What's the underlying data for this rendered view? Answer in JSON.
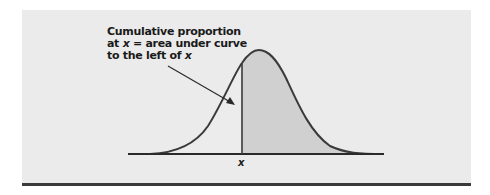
{
  "figure": {
    "annotation": {
      "line1": "Cumulative proportion",
      "line2_prefix": "at ",
      "line2_var": "x",
      "line2_suffix": " = area under curve",
      "line3_prefix": "to the left of ",
      "line3_var": "x"
    },
    "x_axis_label": "x",
    "colors": {
      "panel_background": "#ebebeb",
      "left_region_fill": "#ececec",
      "right_region_fill": "#d0d0d0",
      "curve_stroke": "#3a3a3a",
      "bottom_rule": "#3a3a3a"
    },
    "curve": {
      "type": "normal-density",
      "peak_label": "",
      "shaded_region": "area right of x (darker); area left of x (lighter)"
    }
  }
}
